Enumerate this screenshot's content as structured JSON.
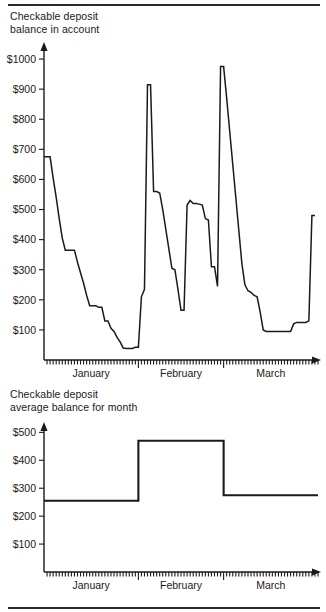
{
  "document": {
    "has_top_rule": true,
    "has_bottom_rule": true,
    "line_color": "#1a1a1a",
    "background": "#ffffff"
  },
  "panels": [
    {
      "id": "balance-in-account",
      "caption": "Checkable deposit\nbalance in account"
    },
    {
      "id": "average-balance-for-month",
      "caption": "Checkable deposit\naverage balance for month"
    }
  ],
  "chart_data": [
    {
      "type": "line",
      "title": "Checkable deposit balance in account",
      "xlabel": "",
      "ylabel": "",
      "grid": false,
      "legend": "none",
      "ylim": [
        0,
        1050
      ],
      "xlim": [
        0,
        90
      ],
      "ytick_labels": [
        "$100",
        "$200",
        "$300",
        "$400",
        "$500",
        "$600",
        "$700",
        "$800",
        "$900",
        "$1000"
      ],
      "ytick_values": [
        100,
        200,
        300,
        400,
        500,
        600,
        700,
        800,
        900,
        1000
      ],
      "xtick_labels": [
        "January",
        "February",
        "March"
      ],
      "xtick_month_starts": [
        0,
        31,
        59
      ],
      "xtick_minor_count": 90,
      "x": [
        0,
        1,
        2,
        3,
        4,
        5,
        6,
        7,
        8,
        9,
        10,
        11,
        12,
        13,
        14,
        15,
        16,
        17,
        18,
        19,
        20,
        21,
        22,
        23,
        24,
        25,
        26,
        27,
        28,
        29,
        30,
        31,
        32,
        33,
        34,
        35,
        36,
        37,
        38,
        39,
        40,
        41,
        42,
        43,
        44,
        45,
        46,
        47,
        48,
        49,
        50,
        51,
        52,
        53,
        54,
        55,
        56,
        57,
        58,
        59,
        60,
        61,
        62,
        63,
        64,
        65,
        66,
        67,
        68,
        69,
        70,
        71,
        72,
        73,
        74,
        75,
        76,
        77,
        78,
        79,
        80,
        81,
        82,
        83,
        84,
        85,
        86,
        87,
        88,
        89
      ],
      "values": [
        675,
        675,
        675,
        605,
        540,
        470,
        405,
        365,
        365,
        365,
        365,
        325,
        290,
        255,
        215,
        180,
        180,
        180,
        175,
        175,
        130,
        130,
        105,
        95,
        75,
        60,
        40,
        38,
        38,
        38,
        42,
        42,
        210,
        235,
        915,
        915,
        560,
        560,
        555,
        500,
        435,
        370,
        305,
        300,
        235,
        165,
        165,
        515,
        530,
        520,
        520,
        518,
        515,
        470,
        465,
        310,
        310,
        245,
        975,
        975,
        870,
        760,
        650,
        540,
        430,
        320,
        250,
        230,
        225,
        215,
        210,
        160,
        100,
        95,
        95,
        95,
        95,
        95,
        95,
        95,
        95,
        95,
        120,
        125,
        125,
        125,
        125,
        130,
        480,
        480
      ]
    },
    {
      "type": "line",
      "title": "Checkable deposit average balance for month",
      "xlabel": "",
      "ylabel": "",
      "grid": false,
      "legend": "none",
      "ylim": [
        0,
        530
      ],
      "xlim": [
        0,
        90
      ],
      "ytick_labels": [
        "$100",
        "$200",
        "$300",
        "$400",
        "$500"
      ],
      "ytick_values": [
        100,
        200,
        300,
        400,
        500
      ],
      "xtick_labels": [
        "January",
        "February",
        "March"
      ],
      "xtick_month_starts": [
        0,
        31,
        59
      ],
      "xtick_minor_count": 90,
      "step": true,
      "categories": [
        "January",
        "February",
        "March"
      ],
      "series": [
        {
          "name": "average balance for month",
          "segments": [
            {
              "month": "January",
              "x_start": 0,
              "x_end": 31,
              "value": 255
            },
            {
              "month": "February",
              "x_start": 31,
              "x_end": 59,
              "value": 470
            },
            {
              "month": "March",
              "x_start": 59,
              "x_end": 90,
              "value": 275
            }
          ]
        }
      ]
    }
  ]
}
